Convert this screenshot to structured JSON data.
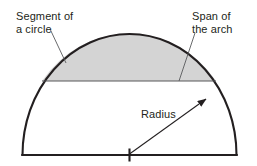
{
  "figure": {
    "background_color": "#ffffff",
    "stroke_color": "#231f20",
    "segment_fill_color": "#d4d4d4",
    "thin_line_color": "#58595b",
    "labels": {
      "segment": {
        "line1": "Segment of",
        "line2": "a circle"
      },
      "span": {
        "line1": "Span of",
        "line2": "the arch"
      },
      "radius": "Radius"
    },
    "geometry": {
      "center_x": 129.5,
      "center_y": 155,
      "radius_x": 107,
      "radius_y": 121,
      "baseline_y": 155,
      "baseline_left_x": 22,
      "baseline_right_x": 237,
      "chord_y": 81,
      "chord_left_x": 42,
      "chord_right_x": 216,
      "arrow_tip_x": 206,
      "arrow_tip_y": 99
    }
  }
}
